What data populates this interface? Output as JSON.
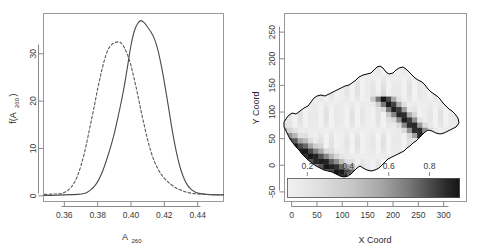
{
  "figure": {
    "title": "",
    "panels": [
      "density-plot",
      "spatial-map"
    ]
  },
  "chart_data": [
    {
      "type": "line",
      "id": "density-panel",
      "title": "",
      "xlabel": "A260",
      "xlabel_base": "A",
      "xlabel_sub": "260",
      "ylabel": "f(A260)",
      "ylabel_base_a": "f(A",
      "ylabel_sub": "260",
      "ylabel_base_b": ")",
      "xlim": [
        0.3475,
        0.4555
      ],
      "ylim": [
        -1.2,
        38.5
      ],
      "xticks": [
        0.36,
        0.38,
        0.4,
        0.42,
        0.44
      ],
      "xticklabels": [
        "0.36",
        "0.38",
        "0.40",
        "0.42",
        "0.44"
      ],
      "yticks": [
        0,
        10,
        20,
        30
      ],
      "yticklabels": [
        "0",
        "10",
        "20",
        "30"
      ],
      "grid": false,
      "legend": "none",
      "series": [
        {
          "name": "solid-density",
          "style": "solid",
          "color": "#4a4a4a",
          "peak_x": 0.406,
          "peak_y": 37.0,
          "x": [
            0.348,
            0.352,
            0.356,
            0.36,
            0.364,
            0.368,
            0.372,
            0.374,
            0.376,
            0.378,
            0.38,
            0.382,
            0.384,
            0.386,
            0.388,
            0.39,
            0.392,
            0.394,
            0.396,
            0.398,
            0.4,
            0.402,
            0.404,
            0.406,
            0.408,
            0.41,
            0.412,
            0.414,
            0.416,
            0.418,
            0.42,
            0.422,
            0.424,
            0.426,
            0.428,
            0.43,
            0.432,
            0.434,
            0.436,
            0.438,
            0.44,
            0.444,
            0.448,
            0.452,
            0.4555
          ],
          "y": [
            0.1,
            0.1,
            0.15,
            0.2,
            0.25,
            0.3,
            0.5,
            0.8,
            1.3,
            2.0,
            3.0,
            4.4,
            6.2,
            8.3,
            10.6,
            13.2,
            16.3,
            19.6,
            23.2,
            27.5,
            31.8,
            34.8,
            36.4,
            37.0,
            36.5,
            35.6,
            34.6,
            33.2,
            31.0,
            27.8,
            24.0,
            19.8,
            15.4,
            11.4,
            8.0,
            5.4,
            3.5,
            2.2,
            1.4,
            0.9,
            0.6,
            0.35,
            0.25,
            0.2,
            0.2
          ]
        },
        {
          "name": "dashed-density",
          "style": "dashed",
          "color": "#5a5a5a",
          "peak_x": 0.3935,
          "peak_y": 32.5,
          "x": [
            0.348,
            0.352,
            0.356,
            0.358,
            0.36,
            0.362,
            0.364,
            0.366,
            0.368,
            0.37,
            0.372,
            0.374,
            0.376,
            0.378,
            0.38,
            0.382,
            0.384,
            0.386,
            0.388,
            0.39,
            0.392,
            0.394,
            0.396,
            0.398,
            0.4,
            0.402,
            0.404,
            0.406,
            0.408,
            0.41,
            0.412,
            0.414,
            0.416,
            0.418,
            0.42,
            0.422,
            0.424,
            0.426,
            0.428,
            0.432,
            0.436,
            0.44,
            0.444,
            0.448,
            0.452,
            0.4555
          ],
          "y": [
            0.3,
            0.35,
            0.4,
            0.5,
            0.7,
            1.1,
            1.8,
            2.8,
            4.3,
            6.4,
            9.0,
            12.2,
            15.6,
            19.0,
            22.6,
            25.8,
            28.6,
            30.7,
            31.8,
            32.3,
            32.5,
            32.3,
            31.3,
            29.7,
            27.5,
            24.6,
            21.4,
            18.0,
            14.8,
            11.8,
            9.3,
            7.3,
            5.8,
            4.6,
            3.7,
            3.0,
            2.4,
            1.9,
            1.5,
            0.9,
            0.55,
            0.4,
            0.3,
            0.25,
            0.25,
            0.25
          ]
        }
      ]
    },
    {
      "type": "heatmap",
      "id": "spatial-map-panel",
      "title": "",
      "xlabel": "X Coord",
      "ylabel": "Y Coord",
      "xlim": [
        -14,
        345
      ],
      "ylim": [
        -68,
        285
      ],
      "xticks": [
        0,
        50,
        100,
        150,
        200,
        250,
        300
      ],
      "xticklabels": [
        "0",
        "50",
        "100",
        "150",
        "200",
        "250",
        "300"
      ],
      "yticks": [
        -50,
        0,
        50,
        100,
        150,
        200,
        250
      ],
      "yticklabels": [
        "-50",
        "0",
        "50",
        "100",
        "150",
        "200",
        "250"
      ],
      "grid": false,
      "region": "Switzerland",
      "colormap": "grayscale-light-to-dark",
      "colorbar": {
        "orientation": "horizontal",
        "vmin": 0.1,
        "vmax": 0.95,
        "ticks": [
          0.2,
          0.4,
          0.6,
          0.8
        ],
        "ticklabels": [
          "0.2",
          "0.4",
          "0.6",
          "0.8"
        ],
        "low_color": "#f0f0f0",
        "high_color": "#141414"
      },
      "value_range_shown": [
        0.1,
        0.95
      ]
    }
  ]
}
